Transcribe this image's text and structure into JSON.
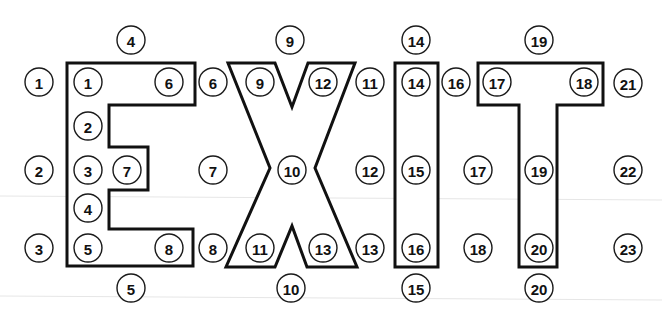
{
  "diagram": {
    "title": "EXIT",
    "colors": {
      "outline": "#111111",
      "badge_stroke": "#1a1a1a",
      "background": "#ffffff"
    },
    "badge_radius": 14,
    "letters": [
      {
        "name": "letter-e",
        "char": "E",
        "points": "67,63 195,63 195,105 109,105 109,147 148,147 148,190 109,190 109,229 193,229 193,266 67,266"
      },
      {
        "name": "letter-x",
        "char": "X",
        "points": "228,63 275,63 292,107 308,63 355,63 315,168 357,267 307,267 292,226 275,267 226,267 270,168"
      },
      {
        "name": "letter-i",
        "char": "I",
        "points": "395,63 438,63 438,267 395,267"
      },
      {
        "name": "letter-t",
        "char": "T",
        "points": "478,63 603,63 603,105 557,105 557,267 519,267 519,105 478,105"
      }
    ],
    "badges": [
      {
        "group": "outer",
        "label": "1",
        "x": 39,
        "y": 82
      },
      {
        "group": "outer",
        "label": "2",
        "x": 39,
        "y": 170
      },
      {
        "group": "outer",
        "label": "3",
        "x": 39,
        "y": 248
      },
      {
        "group": "outer",
        "label": "4",
        "x": 131,
        "y": 40
      },
      {
        "group": "outer",
        "label": "5",
        "x": 131,
        "y": 288
      },
      {
        "group": "inner-e",
        "label": "1",
        "x": 88,
        "y": 82
      },
      {
        "group": "inner-e",
        "label": "2",
        "x": 88,
        "y": 126
      },
      {
        "group": "inner-e",
        "label": "3",
        "x": 88,
        "y": 170
      },
      {
        "group": "inner-e",
        "label": "7",
        "x": 127,
        "y": 170
      },
      {
        "group": "inner-e",
        "label": "4",
        "x": 88,
        "y": 208
      },
      {
        "group": "inner-e",
        "label": "5",
        "x": 88,
        "y": 248
      },
      {
        "group": "inner-e",
        "label": "6",
        "x": 169,
        "y": 82
      },
      {
        "group": "inner-e",
        "label": "8",
        "x": 169,
        "y": 248
      },
      {
        "group": "outer",
        "label": "6",
        "x": 213,
        "y": 82
      },
      {
        "group": "outer",
        "label": "7",
        "x": 213,
        "y": 170
      },
      {
        "group": "outer",
        "label": "8",
        "x": 213,
        "y": 248
      },
      {
        "group": "outer",
        "label": "9",
        "x": 290,
        "y": 40
      },
      {
        "group": "inner-x",
        "label": "9",
        "x": 260,
        "y": 82
      },
      {
        "group": "inner-x",
        "label": "12",
        "x": 323,
        "y": 82
      },
      {
        "group": "inner-x",
        "label": "10",
        "x": 292,
        "y": 170
      },
      {
        "group": "inner-x",
        "label": "11",
        "x": 260,
        "y": 248
      },
      {
        "group": "inner-x",
        "label": "13",
        "x": 323,
        "y": 248
      },
      {
        "group": "outer",
        "label": "10",
        "x": 291,
        "y": 288
      },
      {
        "group": "outer",
        "label": "11",
        "x": 370,
        "y": 82
      },
      {
        "group": "outer",
        "label": "12",
        "x": 370,
        "y": 170
      },
      {
        "group": "outer",
        "label": "13",
        "x": 370,
        "y": 248
      },
      {
        "group": "outer",
        "label": "14",
        "x": 416,
        "y": 40
      },
      {
        "group": "inner-i",
        "label": "14",
        "x": 416,
        "y": 82
      },
      {
        "group": "inner-i",
        "label": "15",
        "x": 416,
        "y": 170
      },
      {
        "group": "inner-i",
        "label": "16",
        "x": 416,
        "y": 248
      },
      {
        "group": "outer",
        "label": "15",
        "x": 416,
        "y": 288
      },
      {
        "group": "outer",
        "label": "16",
        "x": 456,
        "y": 82
      },
      {
        "group": "outer",
        "label": "17",
        "x": 478,
        "y": 170
      },
      {
        "group": "outer",
        "label": "18",
        "x": 478,
        "y": 248
      },
      {
        "group": "outer",
        "label": "19",
        "x": 539,
        "y": 40
      },
      {
        "group": "inner-t",
        "label": "17",
        "x": 497,
        "y": 82
      },
      {
        "group": "inner-t",
        "label": "18",
        "x": 584,
        "y": 82
      },
      {
        "group": "inner-t",
        "label": "19",
        "x": 539,
        "y": 170
      },
      {
        "group": "inner-t",
        "label": "20",
        "x": 539,
        "y": 248
      },
      {
        "group": "outer",
        "label": "20",
        "x": 539,
        "y": 288
      },
      {
        "group": "outer",
        "label": "21",
        "x": 628,
        "y": 83
      },
      {
        "group": "outer",
        "label": "22",
        "x": 628,
        "y": 170
      },
      {
        "group": "outer",
        "label": "23",
        "x": 628,
        "y": 248
      }
    ]
  }
}
